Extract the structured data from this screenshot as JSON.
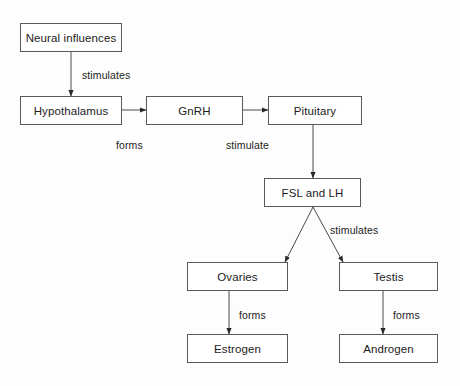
{
  "diagram": {
    "colors": {
      "background": "#fdfdfd",
      "box_fill": "#ffffff",
      "box_border": "#5a5a5a",
      "line": "#4a4a4a",
      "text": "#1c1c1c"
    },
    "nodes": [
      {
        "id": "neural-influences",
        "label": "Neural influences",
        "x": 20,
        "y": 23,
        "w": 102,
        "h": 29
      },
      {
        "id": "hypothalamus",
        "label": "Hypothalamus",
        "x": 20,
        "y": 96,
        "w": 102,
        "h": 29
      },
      {
        "id": "gnrh",
        "label": "GnRH",
        "x": 146,
        "y": 96,
        "w": 97,
        "h": 29
      },
      {
        "id": "pituitary",
        "label": "Pituitary",
        "x": 268,
        "y": 96,
        "w": 94,
        "h": 29
      },
      {
        "id": "fsl-and-lh",
        "label": "FSL and LH",
        "x": 264,
        "y": 178,
        "w": 97,
        "h": 29
      },
      {
        "id": "ovaries",
        "label": "Ovaries",
        "x": 187,
        "y": 262,
        "w": 101,
        "h": 29
      },
      {
        "id": "testis",
        "label": "Testis",
        "x": 339,
        "y": 262,
        "w": 99,
        "h": 29
      },
      {
        "id": "estrogen",
        "label": "Estrogen",
        "x": 187,
        "y": 334,
        "w": 101,
        "h": 29
      },
      {
        "id": "androgen",
        "label": "Androgen",
        "x": 339,
        "y": 334,
        "w": 99,
        "h": 29
      }
    ],
    "edges": [
      {
        "id": "neural-to-hypothalamus",
        "from": "neural-influences",
        "to": "hypothalamus",
        "label": "stimulates",
        "x1": 71,
        "y1": 52,
        "x2": 71,
        "y2": 96
      },
      {
        "id": "hypothalamus-to-gnrh",
        "from": "hypothalamus",
        "to": "gnrh",
        "label": "forms",
        "x1": 122,
        "y1": 110,
        "x2": 146,
        "y2": 110
      },
      {
        "id": "gnrh-to-pituitary",
        "from": "gnrh",
        "to": "pituitary",
        "label": "stimulate",
        "x1": 243,
        "y1": 110,
        "x2": 268,
        "y2": 110
      },
      {
        "id": "pituitary-to-fsl-lh",
        "from": "pituitary",
        "to": "fsl-and-lh",
        "label": "",
        "x1": 313,
        "y1": 125,
        "x2": 313,
        "y2": 178
      },
      {
        "id": "fsl-lh-to-ovaries",
        "from": "fsl-and-lh",
        "to": "ovaries",
        "label": "stimulates",
        "x1": 313,
        "y1": 207,
        "x2": 285,
        "y2": 262
      },
      {
        "id": "fsl-lh-to-testis",
        "from": "fsl-and-lh",
        "to": "testis",
        "label": "",
        "x1": 313,
        "y1": 207,
        "x2": 343,
        "y2": 262
      },
      {
        "id": "ovaries-to-estrogen",
        "from": "ovaries",
        "to": "estrogen",
        "label": "forms",
        "x1": 229,
        "y1": 291,
        "x2": 229,
        "y2": 334
      },
      {
        "id": "testis-to-androgen",
        "from": "testis",
        "to": "androgen",
        "label": "forms",
        "x1": 383,
        "y1": 291,
        "x2": 383,
        "y2": 334
      }
    ],
    "edge_labels": [
      {
        "id": "label-stimulates-neural",
        "text": "stimulates",
        "x": 82,
        "y": 69
      },
      {
        "id": "label-forms-gnrh",
        "text": "forms",
        "x": 116,
        "y": 139
      },
      {
        "id": "label-stimulate-pituitary",
        "text": "stimulate",
        "x": 226,
        "y": 139
      },
      {
        "id": "label-stimulates-gonads",
        "text": "stimulates",
        "x": 330,
        "y": 224
      },
      {
        "id": "label-forms-estrogen",
        "text": "forms",
        "x": 239,
        "y": 309
      },
      {
        "id": "label-forms-androgen",
        "text": "forms",
        "x": 393,
        "y": 309
      }
    ]
  }
}
